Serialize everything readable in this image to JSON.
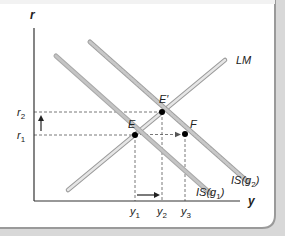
{
  "diagram": {
    "axes": {
      "y_axis_label": "r",
      "x_axis_label": "y"
    },
    "interest_rates": {
      "r1": {
        "base": "r",
        "sub": "1"
      },
      "r2": {
        "base": "r",
        "sub": "2"
      }
    },
    "outputs": {
      "y1": {
        "base": "y",
        "sub": "1"
      },
      "y2": {
        "base": "y",
        "sub": "2"
      },
      "y3": {
        "base": "y",
        "sub": "3"
      }
    },
    "points": {
      "E": "E",
      "E_prime": "E′",
      "F": "F"
    },
    "curves": {
      "LM": "LM",
      "IS_g1": {
        "pre": "IS(g",
        "sub": "1",
        "post": ")"
      },
      "IS_g2": {
        "pre": "IS(g",
        "sub": "2",
        "post": ")"
      }
    },
    "colors": {
      "axis": "#333333",
      "curve_fill": "#bdbdbd",
      "curve_outline": "#8c8c8c",
      "dashed": "#555555",
      "point": "#000000",
      "frame": "#9e9e9e"
    }
  }
}
